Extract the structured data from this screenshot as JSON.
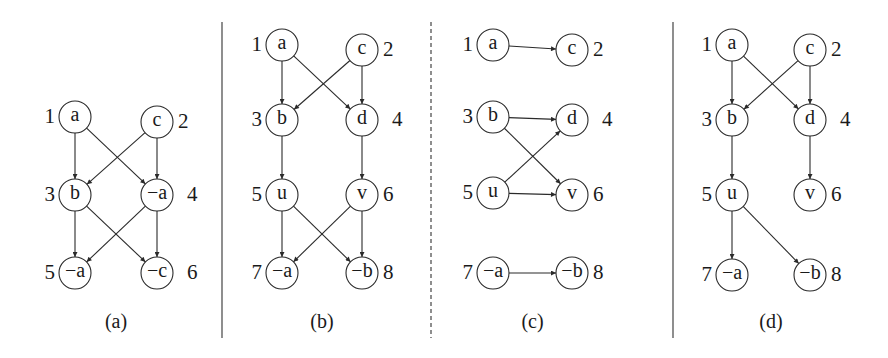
{
  "figure": {
    "panels": [
      {
        "id": "a",
        "caption": "(a)",
        "nodes": [
          {
            "id": 1,
            "label": "a",
            "x": 75,
            "y": 117
          },
          {
            "id": 2,
            "label": "c",
            "x": 157,
            "y": 122
          },
          {
            "id": 3,
            "label": "b",
            "x": 75,
            "y": 195
          },
          {
            "id": 4,
            "label": "−a",
            "x": 157,
            "y": 195
          },
          {
            "id": 5,
            "label": "−a",
            "x": 75,
            "y": 273
          },
          {
            "id": 6,
            "label": "−c",
            "x": 157,
            "y": 273
          }
        ],
        "edges": [
          [
            1,
            3
          ],
          [
            1,
            4
          ],
          [
            2,
            3
          ],
          [
            2,
            4
          ],
          [
            3,
            5
          ],
          [
            3,
            6
          ],
          [
            4,
            5
          ],
          [
            4,
            6
          ]
        ]
      },
      {
        "id": "b",
        "caption": "(b)",
        "nodes": [
          {
            "id": 1,
            "label": "a",
            "x": 282,
            "y": 45
          },
          {
            "id": 2,
            "label": "c",
            "x": 362,
            "y": 50
          },
          {
            "id": 3,
            "label": "b",
            "x": 282,
            "y": 120
          },
          {
            "id": 4,
            "label": "d",
            "x": 362,
            "y": 120
          },
          {
            "id": 5,
            "label": "u",
            "x": 282,
            "y": 195
          },
          {
            "id": 6,
            "label": "v",
            "x": 362,
            "y": 195
          },
          {
            "id": 7,
            "label": "−a",
            "x": 282,
            "y": 273
          },
          {
            "id": 8,
            "label": "−b",
            "x": 362,
            "y": 273
          }
        ],
        "edges": [
          [
            1,
            3
          ],
          [
            1,
            4
          ],
          [
            2,
            3
          ],
          [
            2,
            4
          ],
          [
            3,
            5
          ],
          [
            4,
            6
          ],
          [
            5,
            7
          ],
          [
            5,
            8
          ],
          [
            6,
            7
          ],
          [
            6,
            8
          ]
        ]
      },
      {
        "id": "c",
        "caption": "(c)",
        "nodes": [
          {
            "id": 1,
            "label": "a",
            "x": 493,
            "y": 45
          },
          {
            "id": 2,
            "label": "c",
            "x": 572,
            "y": 50
          },
          {
            "id": 3,
            "label": "b",
            "x": 493,
            "y": 117
          },
          {
            "id": 4,
            "label": "d",
            "x": 572,
            "y": 120
          },
          {
            "id": 5,
            "label": "u",
            "x": 493,
            "y": 193
          },
          {
            "id": 6,
            "label": "v",
            "x": 572,
            "y": 195
          },
          {
            "id": 7,
            "label": "−a",
            "x": 493,
            "y": 273
          },
          {
            "id": 8,
            "label": "−b",
            "x": 572,
            "y": 273
          }
        ],
        "edges": [
          [
            1,
            2
          ],
          [
            3,
            4
          ],
          [
            3,
            6
          ],
          [
            5,
            4
          ],
          [
            5,
            6
          ],
          [
            7,
            8
          ]
        ]
      },
      {
        "id": "d",
        "caption": "(d)",
        "nodes": [
          {
            "id": 1,
            "label": "a",
            "x": 732,
            "y": 45
          },
          {
            "id": 2,
            "label": "c",
            "x": 810,
            "y": 50
          },
          {
            "id": 3,
            "label": "b",
            "x": 732,
            "y": 120
          },
          {
            "id": 4,
            "label": "d",
            "x": 810,
            "y": 120
          },
          {
            "id": 5,
            "label": "u",
            "x": 732,
            "y": 195
          },
          {
            "id": 6,
            "label": "v",
            "x": 810,
            "y": 195
          },
          {
            "id": 7,
            "label": "−a",
            "x": 732,
            "y": 275
          },
          {
            "id": 8,
            "label": "−b",
            "x": 810,
            "y": 275
          }
        ],
        "edges": [
          [
            1,
            3
          ],
          [
            1,
            4
          ],
          [
            2,
            3
          ],
          [
            2,
            4
          ],
          [
            3,
            5
          ],
          [
            4,
            6
          ],
          [
            5,
            7
          ],
          [
            5,
            8
          ]
        ]
      }
    ],
    "dividers": [
      {
        "x": 222,
        "style": "solid"
      },
      {
        "x": 431,
        "style": "dashed"
      },
      {
        "x": 673,
        "style": "solid"
      }
    ],
    "node_radius": 16
  }
}
